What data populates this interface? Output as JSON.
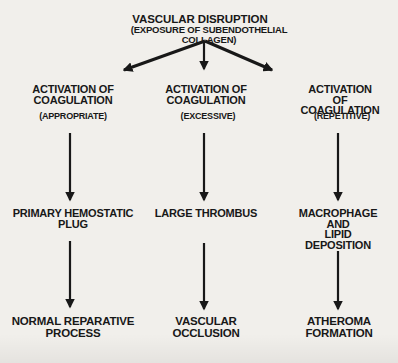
{
  "diagram": {
    "title": "VASCULAR DISRUPTION",
    "subtitle": "(EXPOSURE OF SUBENDOTHELIAL COLLAGEN)",
    "columns": [
      {
        "activation": "ACTIVATION OF\nCOAGULATION",
        "qualifier": "(APPROPRIATE)",
        "intermediate": "PRIMARY HEMOSTATIC\nPLUG",
        "outcome": "NORMAL REPARATIVE\nPROCESS"
      },
      {
        "activation": "ACTIVATION OF\nCOAGULATION",
        "qualifier": "(EXCESSIVE)",
        "intermediate": "LARGE THROMBUS",
        "outcome": "VASCULAR\nOCCLUSION"
      },
      {
        "activation": "ACTIVATION OF\nCOAGULATION",
        "qualifier": "(REPETITIVE)",
        "intermediate": "MACROPHAGE\nAND\nLIPID DEPOSITION",
        "outcome": "ATHEROMA\nFORMATION"
      }
    ],
    "colors": {
      "background": "#f1efeb",
      "text": "#181818",
      "arrow": "#181818"
    }
  }
}
